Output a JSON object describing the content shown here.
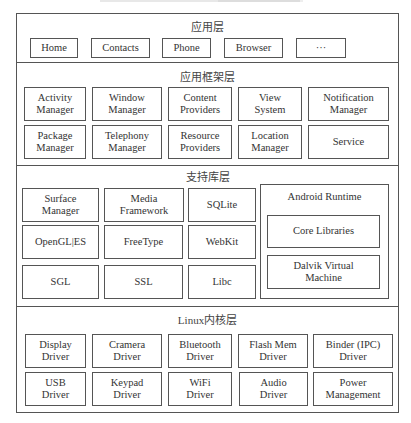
{
  "diagram": {
    "layers": [
      {
        "id": "application",
        "title": "应用层",
        "items": [
          "Home",
          "Contacts",
          "Phone",
          "Browser",
          "···"
        ]
      },
      {
        "id": "framework",
        "title": "应用框架层",
        "items": [
          "Activity\nManager",
          "Window\nManager",
          "Content\nProviders",
          "View\nSystem",
          "Notification\nManager",
          "Package\nManager",
          "Telephony\nManager",
          "Resource\nProviders",
          "Location\nManager",
          "Service"
        ]
      },
      {
        "id": "libraries",
        "title": "支持库层",
        "items": [
          "Surface\nManager",
          "Media\nFramework",
          "SQLite",
          "OpenGL|ES",
          "FreeType",
          "WebKit",
          "SGL",
          "SSL",
          "Libc"
        ],
        "runtime": {
          "title": "Android Runtime",
          "items": [
            "Core Libraries",
            "Dalvik Virtual\nMachine"
          ]
        }
      },
      {
        "id": "kernel",
        "title": "Linux内核层",
        "items": [
          "Display\nDriver",
          "Cramera\nDriver",
          "Bluetooth\nDriver",
          "Flash Mem\nDriver",
          "Binder (IPC)\nDriver",
          "USB\nDriver",
          "Keypad\nDriver",
          "WiFi\nDriver",
          "Audio\nDriver",
          "Power\nManagement"
        ]
      }
    ]
  },
  "colors": {
    "border": "#555555",
    "text": "#333333",
    "background": "#ffffff"
  }
}
